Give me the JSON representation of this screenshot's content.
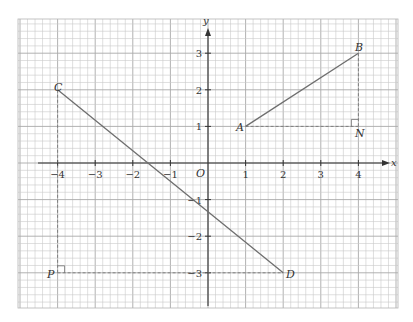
{
  "diagram": {
    "type": "coordinate-grid",
    "axes": {
      "x_label": "x",
      "y_label": "y",
      "origin_label": "O",
      "x_ticks": [
        {
          "value": -4,
          "label": "−4"
        },
        {
          "value": -3,
          "label": "−3"
        },
        {
          "value": -2,
          "label": "−2"
        },
        {
          "value": -1,
          "label": "−1"
        },
        {
          "value": 1,
          "label": "1"
        },
        {
          "value": 2,
          "label": "2"
        },
        {
          "value": 3,
          "label": "3"
        },
        {
          "value": 4,
          "label": "4"
        }
      ],
      "y_ticks": [
        {
          "value": 3,
          "label": "3"
        },
        {
          "value": 2,
          "label": "2"
        },
        {
          "value": 1,
          "label": "1"
        },
        {
          "value": -1,
          "label": "−1"
        },
        {
          "value": -2,
          "label": "−2"
        },
        {
          "value": -3,
          "label": "−3"
        }
      ]
    },
    "points": {
      "A": {
        "label": "A",
        "x": 1,
        "y": 1
      },
      "B": {
        "label": "B",
        "x": 4,
        "y": 3
      },
      "N": {
        "label": "N",
        "x": 4,
        "y": 1
      },
      "C": {
        "label": "C",
        "x": -4,
        "y": 2
      },
      "D": {
        "label": "D",
        "x": 2,
        "y": -3
      },
      "P": {
        "label": "P",
        "x": -4,
        "y": -3
      }
    },
    "segments": [
      {
        "from": "A",
        "to": "B",
        "style": "solid"
      },
      {
        "from": "C",
        "to": "D",
        "style": "solid"
      },
      {
        "from": "A",
        "to": "N",
        "style": "dashed"
      },
      {
        "from": "B",
        "to": "N",
        "style": "dashed"
      },
      {
        "from": "C",
        "to": "P",
        "style": "dashed"
      },
      {
        "from": "P",
        "to": "D",
        "style": "dashed"
      }
    ],
    "right_angles": [
      "N",
      "P"
    ]
  }
}
